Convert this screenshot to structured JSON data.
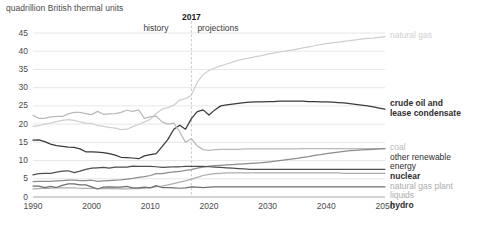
{
  "units_label": "quadrillion British thermal units",
  "divider": {
    "year_label": "2017",
    "left_label": "history",
    "right_label": "projections"
  },
  "chart_data": {
    "type": "line",
    "title": "",
    "subtitle": "",
    "xlabel": "",
    "ylabel": "quadrillion British thermal units",
    "xlim": [
      1990,
      2050
    ],
    "ylim": [
      0,
      45
    ],
    "yticks": [
      0,
      5,
      10,
      15,
      20,
      25,
      30,
      35,
      40,
      45
    ],
    "xticks": [
      1990,
      2000,
      2010,
      2020,
      2030,
      2040,
      2050
    ],
    "grid": true,
    "legend_position": "right",
    "annotations": [
      {
        "text": "2017",
        "x": 2017,
        "type": "divider-title"
      },
      {
        "text": "history",
        "x": 2010,
        "type": "era"
      },
      {
        "text": "projections",
        "x": 2024,
        "type": "era"
      }
    ],
    "x": [
      1990,
      1991,
      1992,
      1993,
      1994,
      1995,
      1996,
      1997,
      1998,
      1999,
      2000,
      2001,
      2002,
      2003,
      2004,
      2005,
      2006,
      2007,
      2008,
      2009,
      2010,
      2011,
      2012,
      2013,
      2014,
      2015,
      2016,
      2017,
      2018,
      2019,
      2020,
      2021,
      2022,
      2023,
      2024,
      2025,
      2026,
      2027,
      2028,
      2029,
      2030,
      2031,
      2032,
      2033,
      2034,
      2035,
      2036,
      2037,
      2038,
      2039,
      2040,
      2041,
      2042,
      2043,
      2044,
      2045,
      2046,
      2047,
      2048,
      2049,
      2050
    ],
    "series": [
      {
        "name": "natural gas",
        "color": "#cfcfcf",
        "label_lines": [
          "natural gas"
        ],
        "values": [
          19.4,
          19.6,
          20.0,
          20.3,
          20.7,
          21.0,
          21.2,
          21.0,
          20.6,
          20.3,
          20.2,
          19.6,
          19.4,
          19.1,
          18.9,
          18.5,
          18.6,
          19.3,
          19.9,
          20.6,
          21.3,
          22.9,
          24.1,
          24.5,
          25.2,
          26.6,
          27.0,
          27.9,
          31.5,
          33.6,
          34.7,
          35.4,
          36.0,
          36.5,
          37.0,
          37.5,
          37.9,
          38.2,
          38.5,
          38.8,
          39.2,
          39.5,
          39.8,
          40.0,
          40.3,
          40.6,
          40.9,
          41.2,
          41.5,
          41.8,
          42.1,
          42.3,
          42.5,
          42.7,
          42.9,
          43.1,
          43.3,
          43.5,
          43.6,
          43.8,
          44.0
        ]
      },
      {
        "name": "crude oil and lease condensate",
        "color": "#3a3a3a",
        "label_lines": [
          "crude oil and",
          "lease condensate"
        ],
        "values": [
          15.6,
          15.7,
          15.2,
          14.5,
          14.1,
          13.9,
          13.7,
          13.6,
          13.2,
          12.4,
          12.4,
          12.3,
          12.2,
          11.9,
          11.5,
          10.9,
          10.8,
          10.7,
          10.5,
          11.3,
          11.6,
          11.9,
          13.8,
          15.8,
          18.6,
          19.7,
          18.6,
          21.5,
          23.4,
          23.9,
          22.5,
          23.9,
          25.0,
          25.3,
          25.5,
          25.7,
          25.9,
          26.0,
          26.1,
          26.1,
          26.2,
          26.2,
          26.3,
          26.3,
          26.3,
          26.3,
          26.3,
          26.2,
          26.2,
          26.1,
          26.1,
          26.0,
          25.9,
          25.8,
          25.6,
          25.4,
          25.2,
          25.0,
          24.7,
          24.4,
          24.1
        ]
      },
      {
        "name": "coal",
        "color": "#b9b9b9",
        "label_lines": [
          "coal"
        ],
        "values": [
          22.4,
          21.6,
          21.6,
          22.0,
          22.1,
          22.1,
          22.8,
          23.2,
          23.2,
          22.9,
          22.6,
          23.5,
          22.7,
          22.8,
          22.9,
          23.2,
          23.8,
          23.5,
          23.9,
          21.6,
          22.0,
          22.2,
          20.6,
          20.0,
          20.3,
          17.9,
          15.0,
          16.0,
          14.0,
          13.0,
          12.8,
          13.0,
          13.1,
          13.1,
          13.1,
          13.1,
          13.2,
          13.2,
          13.2,
          13.2,
          13.2,
          13.2,
          13.2,
          13.2,
          13.2,
          13.2,
          13.3,
          13.3,
          13.3,
          13.3,
          13.3,
          13.3,
          13.3,
          13.3,
          13.3,
          13.3,
          13.3,
          13.3,
          13.3,
          13.3,
          13.3
        ]
      },
      {
        "name": "other renewable energy",
        "color": "#8c8c8c",
        "label_lines": [
          "other renewable",
          "energy"
        ],
        "values": [
          4.2,
          4.3,
          4.3,
          4.3,
          4.4,
          4.5,
          4.6,
          4.6,
          4.5,
          4.5,
          4.6,
          4.3,
          4.4,
          4.5,
          4.6,
          4.7,
          4.9,
          5.1,
          5.4,
          5.6,
          5.9,
          6.4,
          6.4,
          6.7,
          6.9,
          7.0,
          7.3,
          7.5,
          7.9,
          8.2,
          8.5,
          8.6,
          8.7,
          8.8,
          8.9,
          9.0,
          9.1,
          9.2,
          9.3,
          9.4,
          9.6,
          9.8,
          10.0,
          10.2,
          10.4,
          10.6,
          10.9,
          11.1,
          11.4,
          11.6,
          11.9,
          12.1,
          12.3,
          12.5,
          12.7,
          12.8,
          12.9,
          13.0,
          13.1,
          13.2,
          13.3
        ]
      },
      {
        "name": "nuclear",
        "color": "#4f4f4f",
        "label_lines": [
          "nuclear"
        ],
        "values": [
          6.1,
          6.4,
          6.5,
          6.5,
          6.8,
          7.1,
          7.2,
          6.7,
          7.1,
          7.6,
          7.9,
          8.0,
          8.1,
          7.9,
          8.2,
          8.2,
          8.2,
          8.5,
          8.4,
          8.4,
          8.4,
          8.3,
          8.1,
          8.2,
          8.3,
          8.3,
          8.4,
          8.4,
          8.4,
          8.4,
          8.3,
          8.2,
          8.1,
          8.0,
          7.9,
          7.8,
          7.7,
          7.6,
          7.6,
          7.6,
          7.6,
          7.6,
          7.6,
          7.6,
          7.6,
          7.6,
          7.6,
          7.6,
          7.6,
          7.6,
          7.6,
          7.6,
          7.6,
          7.6,
          7.6,
          7.6,
          7.6,
          7.6,
          7.6,
          7.6,
          7.6
        ]
      },
      {
        "name": "natural gas plant liquids",
        "color": "#adadad",
        "label_lines": [
          "natural gas plant",
          "liquids"
        ],
        "values": [
          2.2,
          2.3,
          2.4,
          2.4,
          2.5,
          2.5,
          2.5,
          2.5,
          2.4,
          2.4,
          2.4,
          2.3,
          2.3,
          2.3,
          2.3,
          2.2,
          2.2,
          2.3,
          2.3,
          2.4,
          2.6,
          2.8,
          3.0,
          3.3,
          3.7,
          4.1,
          4.4,
          4.9,
          5.4,
          5.9,
          6.2,
          6.4,
          6.5,
          6.6,
          6.6,
          6.6,
          6.6,
          6.6,
          6.6,
          6.6,
          6.6,
          6.6,
          6.6,
          6.6,
          6.6,
          6.6,
          6.6,
          6.6,
          6.6,
          6.6,
          6.6,
          6.6,
          6.6,
          6.5,
          6.5,
          6.5,
          6.5,
          6.5,
          6.5,
          6.5,
          6.5
        ]
      },
      {
        "name": "hydro",
        "color": "#6e6e6e",
        "label_lines": [
          "hydro"
        ],
        "values": [
          3.0,
          3.0,
          2.6,
          2.9,
          2.6,
          3.2,
          3.6,
          3.6,
          3.3,
          3.3,
          2.8,
          2.2,
          2.7,
          2.8,
          2.7,
          2.7,
          2.9,
          2.5,
          2.5,
          2.7,
          2.5,
          3.1,
          2.6,
          2.6,
          2.5,
          2.4,
          2.5,
          2.8,
          2.7,
          2.6,
          2.7,
          2.8,
          2.8,
          2.8,
          2.8,
          2.8,
          2.8,
          2.8,
          2.8,
          2.8,
          2.8,
          2.8,
          2.8,
          2.8,
          2.8,
          2.8,
          2.8,
          2.8,
          2.8,
          2.8,
          2.8,
          2.8,
          2.8,
          2.8,
          2.8,
          2.8,
          2.8,
          2.8,
          2.8,
          2.8,
          2.8
        ]
      }
    ],
    "legend": [
      {
        "label": "natural gas",
        "color": "#cfcfcf"
      },
      {
        "label": "crude oil and lease condensate",
        "color": "#3a3a3a"
      },
      {
        "label": "coal",
        "color": "#b9b9b9"
      },
      {
        "label": "other renewable energy",
        "color": "#8c8c8c"
      },
      {
        "label": "nuclear",
        "color": "#4f4f4f"
      },
      {
        "label": "natural gas plant liquids",
        "color": "#adadad"
      },
      {
        "label": "hydro",
        "color": "#6e6e6e"
      }
    ]
  }
}
